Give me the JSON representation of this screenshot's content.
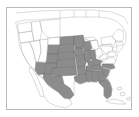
{
  "figure": {
    "kind": "choropleth-thumbnail",
    "title": "",
    "caption": "",
    "frame": {
      "border_color": "#b9b9b9",
      "background_color": "#ffffff",
      "x": 6,
      "y": 7,
      "width": 126,
      "height": 103
    }
  },
  "map": {
    "region": "United States",
    "projection_note": "continental United States with Florida peninsula and Caribbean islands",
    "outline_color": "#b0b0b0",
    "state_border_color": "#9a9a9a",
    "highlight_fill": "#8c8c8c",
    "highlight_border": "#6e6e6e",
    "unhighlighted_fill": "#ffffff",
    "water_fill": "#ffffff"
  },
  "legend": {
    "visible": false,
    "entries": [
      {
        "label": "highlighted states",
        "color": "#8c8c8c"
      },
      {
        "label": "other states",
        "color": "#ffffff"
      }
    ]
  },
  "chart_data": {
    "type": "map",
    "title": "",
    "xlabel": "",
    "ylabel": "",
    "categories": [
      "highlighted",
      "not highlighted"
    ],
    "values": [
      1,
      0
    ],
    "highlighted_regions": [
      "North Dakota",
      "South Dakota",
      "Nebraska",
      "Kansas",
      "Oklahoma",
      "Texas",
      "Minnesota",
      "Iowa",
      "Missouri",
      "Arkansas",
      "Louisiana",
      "Wisconsin",
      "Illinois",
      "Mississippi",
      "Alabama",
      "Tennessee",
      "Kentucky",
      "Georgia",
      "Florida",
      "South Carolina",
      "North Carolina",
      "Colorado",
      "New Mexico",
      "Arizona",
      "Wyoming",
      "Indiana"
    ],
    "unhighlighted_regions": [
      "Washington",
      "Oregon",
      "California",
      "Nevada",
      "Utah",
      "Idaho",
      "Montana",
      "Michigan",
      "Ohio",
      "West Virginia",
      "Virginia",
      "Pennsylvania",
      "New York",
      "Maine",
      "Vermont",
      "New Hampshire",
      "Massachusetts",
      "Connecticut",
      "Rhode Island",
      "New Jersey",
      "Delaware",
      "Maryland"
    ]
  }
}
